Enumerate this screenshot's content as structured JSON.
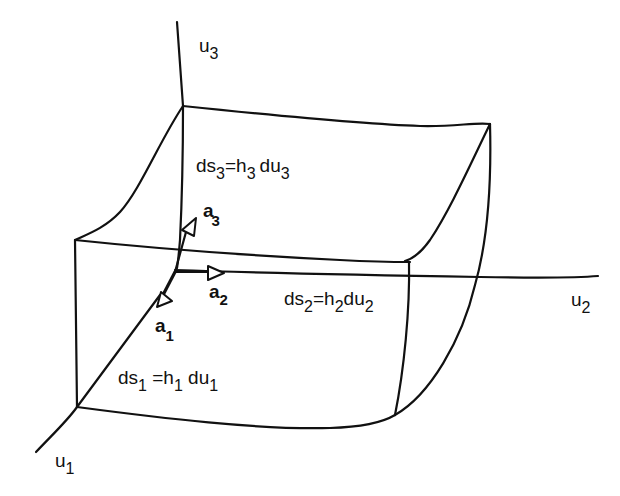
{
  "diagram": {
    "stroke_color": "#111111",
    "background": "#ffffff",
    "axes": [
      {
        "id": "u1",
        "label": "u",
        "subscript": "1"
      },
      {
        "id": "u2",
        "label": "u",
        "subscript": "2"
      },
      {
        "id": "u3",
        "label": "u",
        "subscript": "3"
      }
    ],
    "unit_vectors": [
      {
        "id": "a1",
        "label": "a",
        "subscript": "1"
      },
      {
        "id": "a2",
        "label": "a",
        "subscript": "2"
      },
      {
        "id": "a3",
        "label": "a",
        "subscript": "3"
      }
    ],
    "arc_lengths": [
      {
        "id": "ds1",
        "parts": [
          "ds",
          "1",
          " =h",
          "1",
          " du",
          "1"
        ],
        "text": "ds1 = h1 du1"
      },
      {
        "id": "ds2",
        "parts": [
          "ds",
          "2",
          "=h",
          "2",
          "du",
          "2"
        ],
        "text": "ds2 = h2 du2"
      },
      {
        "id": "ds3",
        "parts": [
          "ds",
          "3",
          "=h",
          "3",
          "du",
          "3"
        ],
        "text": "ds3 = h3 du3"
      }
    ]
  }
}
